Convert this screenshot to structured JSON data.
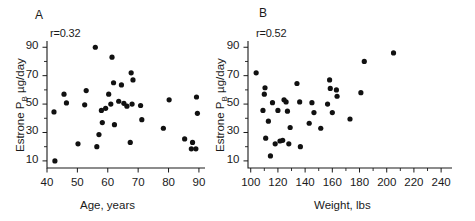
{
  "figure": {
    "background": "#ffffff",
    "ink_color": "#111111",
    "faint_top_text": "",
    "panels": [
      "A",
      "B"
    ]
  },
  "chart_data": [
    {
      "type": "scatter",
      "panel": "A",
      "title": "",
      "annotation": "r=0.32",
      "r_value": 0.32,
      "xlabel": "Age, years",
      "ylabel": "Estrone P_B µg/day",
      "ylabel_parts": {
        "pre": "Estrone P",
        "sub": "B",
        "post": " µg/day"
      },
      "xlim": [
        40,
        92
      ],
      "ylim": [
        5,
        93
      ],
      "xticks": [
        40,
        50,
        60,
        70,
        80,
        90
      ],
      "xticklabels": [
        "40",
        "50",
        "60",
        "70",
        "80",
        "90"
      ],
      "yticks": [
        10,
        30,
        50,
        70,
        90
      ],
      "yticklabels": [
        "10",
        "30",
        "50",
        "70",
        "90"
      ],
      "y_minor_ticks": [
        20,
        40,
        60,
        80
      ],
      "grid": false,
      "legend": "none",
      "points": [
        [
          42.3,
          44.5
        ],
        [
          42.6,
          10.0
        ],
        [
          45.6,
          57.0
        ],
        [
          46.4,
          50.8
        ],
        [
          50.2,
          22.0
        ],
        [
          52.4,
          49.5
        ],
        [
          52.9,
          59.5
        ],
        [
          55.9,
          90.0
        ],
        [
          56.4,
          20.0
        ],
        [
          57.1,
          28.5
        ],
        [
          57.9,
          45.5
        ],
        [
          58.2,
          37.0
        ],
        [
          59.3,
          47.0
        ],
        [
          60.3,
          57.0
        ],
        [
          61.0,
          50.0
        ],
        [
          61.4,
          83.0
        ],
        [
          61.9,
          65.0
        ],
        [
          62.2,
          35.5
        ],
        [
          63.6,
          52.0
        ],
        [
          64.5,
          63.5
        ],
        [
          65.3,
          50.5
        ],
        [
          66.3,
          48.5
        ],
        [
          67.4,
          23.0
        ],
        [
          67.7,
          72.0
        ],
        [
          68.0,
          50.0
        ],
        [
          68.3,
          67.0
        ],
        [
          70.8,
          49.0
        ],
        [
          71.2,
          39.0
        ],
        [
          78.3,
          33.0
        ],
        [
          80.2,
          53.0
        ],
        [
          85.3,
          25.5
        ],
        [
          87.5,
          18.5
        ],
        [
          87.9,
          23.0
        ],
        [
          89.0,
          18.5
        ],
        [
          89.2,
          55.0
        ],
        [
          89.5,
          43.5
        ]
      ]
    },
    {
      "type": "scatter",
      "panel": "B",
      "title": "",
      "annotation": "r=0.52",
      "r_value": 0.52,
      "xlabel": "Weight, lbs",
      "ylabel": "Estrone P_B µg/day",
      "ylabel_parts": {
        "pre": "Estrone P",
        "sub": "B",
        "post": " µg/day"
      },
      "xlim": [
        98,
        248
      ],
      "ylim": [
        5,
        93
      ],
      "xticks": [
        100,
        120,
        140,
        160,
        180,
        200,
        220,
        240
      ],
      "xticklabels": [
        "100",
        "120",
        "140",
        "160",
        "180",
        "200",
        "220",
        "240"
      ],
      "x_minor_ticks": [
        110,
        130,
        150,
        170,
        190,
        210,
        230
      ],
      "yticks": [
        10,
        30,
        50,
        70,
        90
      ],
      "yticklabels": [
        "10",
        "30",
        "50",
        "70",
        "90"
      ],
      "y_minor_ticks": [
        20,
        40,
        60,
        80
      ],
      "grid": false,
      "legend": "none",
      "points": [
        [
          104.0,
          72.0
        ],
        [
          110.0,
          57.0
        ],
        [
          110.5,
          61.5
        ],
        [
          109.0,
          45.5
        ],
        [
          111.0,
          26.0
        ],
        [
          113.0,
          38.0
        ],
        [
          114.5,
          13.5
        ],
        [
          116.0,
          51.0
        ],
        [
          118.0,
          22.0
        ],
        [
          120.0,
          45.5
        ],
        [
          121.5,
          24.0
        ],
        [
          123.5,
          24.5
        ],
        [
          124.5,
          53.0
        ],
        [
          126.0,
          51.5
        ],
        [
          127.0,
          45.0
        ],
        [
          128.0,
          22.0
        ],
        [
          129.0,
          33.5
        ],
        [
          134.0,
          64.5
        ],
        [
          136.0,
          51.5
        ],
        [
          136.5,
          20.0
        ],
        [
          143.0,
          36.5
        ],
        [
          145.0,
          51.0
        ],
        [
          146.5,
          44.0
        ],
        [
          151.5,
          33.0
        ],
        [
          156.5,
          50.0
        ],
        [
          158.0,
          67.0
        ],
        [
          158.5,
          61.0
        ],
        [
          160.0,
          44.0
        ],
        [
          163.0,
          60.0
        ],
        [
          163.5,
          55.5
        ],
        [
          173.0,
          39.5
        ],
        [
          181.0,
          58.0
        ],
        [
          183.5,
          80.0
        ],
        [
          205.0,
          86.0
        ]
      ]
    }
  ]
}
